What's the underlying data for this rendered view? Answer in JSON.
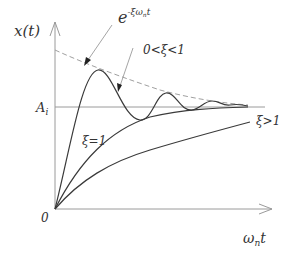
{
  "diagram": {
    "y_axis_label": "x(t)",
    "x_axis_label": "ω",
    "x_axis_label_sub": "n",
    "x_axis_label_tail": "t",
    "origin_label": "0",
    "steady_state_label": "A",
    "steady_state_sub": "i",
    "envelope_label_base": "e",
    "envelope_label_exp": "-ξω",
    "envelope_label_exp_sub": "n",
    "envelope_label_exp_tail": "t",
    "underdamped_label": "0<ξ<1",
    "critical_label": "ξ=1",
    "overdamped_label": "ξ>1",
    "colors": {
      "axis": "#9a9a9a",
      "curve": "#3a3a3a",
      "envelope": "#9a9a9a",
      "text": "#333333"
    }
  }
}
